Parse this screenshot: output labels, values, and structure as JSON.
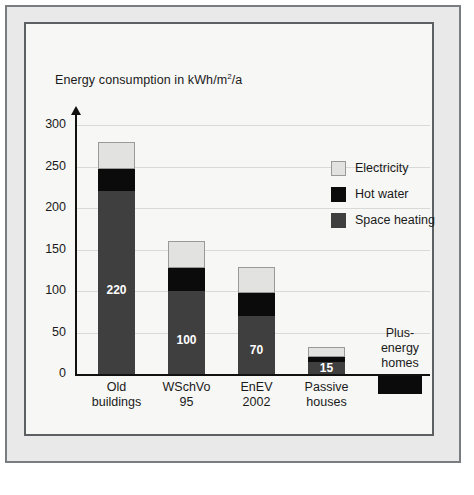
{
  "chart_data": {
    "type": "bar",
    "title_main": "Energy consumption in kWh/m",
    "title_sup": "2",
    "title_tail": "/a",
    "xlabel": "",
    "ylabel": "",
    "stacked": true,
    "grid": true,
    "legend_position": "right",
    "ylim": [
      -30,
      300
    ],
    "yticks": [
      0,
      50,
      100,
      150,
      200,
      250,
      300
    ],
    "ytick_labels": [
      "0",
      "50",
      "100",
      "150",
      "200",
      "250",
      "300"
    ],
    "categories": [
      "Old buildings",
      "WSchVo 95",
      "EnEV 2002",
      "Passive houses",
      "Plus-energy homes"
    ],
    "category_lines": [
      [
        "Old",
        "buildings"
      ],
      [
        "WSchVo",
        "95"
      ],
      [
        "EnEV",
        "2002"
      ],
      [
        "Passive",
        "houses"
      ],
      [
        "Plus-",
        "energy",
        "homes"
      ]
    ],
    "series": [
      {
        "name": "Space heating",
        "color": "#3f3f3f",
        "values": [
          220,
          100,
          70,
          15,
          -22
        ]
      },
      {
        "name": "Hot water",
        "color": "#0b0b0b",
        "values": [
          27,
          28,
          27,
          5,
          0
        ]
      },
      {
        "name": "Electricity",
        "color": "#e2e2e0",
        "values": [
          32,
          32,
          32,
          12,
          0
        ]
      }
    ],
    "totals": [
      279,
      160,
      129,
      32,
      -22
    ],
    "data_labels": [
      "220",
      "100",
      "70",
      "15",
      ""
    ],
    "legend": [
      {
        "label": "Electricity",
        "color": "#e2e2e0"
      },
      {
        "label": "Hot water",
        "color": "#0b0b0b"
      },
      {
        "label": "Space heating",
        "color": "#3f3f3f"
      }
    ]
  },
  "caption": ""
}
